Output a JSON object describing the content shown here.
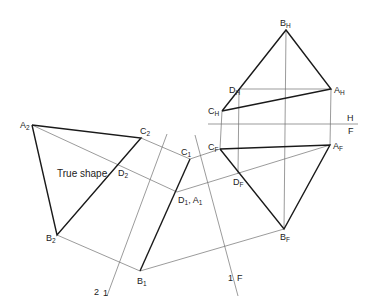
{
  "diagram": {
    "type": "descriptive-geometry-true-shape",
    "annotation": "True shape",
    "reference_lines": {
      "HF": {
        "upper_label": "H",
        "lower_label": "F"
      },
      "F1": {
        "label_left": "1",
        "label_right": "F"
      },
      "12": {
        "label_left": "2",
        "label_right": "1"
      }
    },
    "points": {
      "BH": {
        "base": "B",
        "sub": "H"
      },
      "DH": {
        "base": "D",
        "sub": "H"
      },
      "AH": {
        "base": "A",
        "sub": "H"
      },
      "CH": {
        "base": "C",
        "sub": "H"
      },
      "CF": {
        "base": "C",
        "sub": "F"
      },
      "AF": {
        "base": "A",
        "sub": "F"
      },
      "DF": {
        "base": "D",
        "sub": "F"
      },
      "BF": {
        "base": "B",
        "sub": "F"
      },
      "C1": {
        "base": "C",
        "sub": "1"
      },
      "D1A1": {
        "base": "D",
        "sub": "1",
        "sep": ", ",
        "base2": "A",
        "sub2": "1"
      },
      "B1": {
        "base": "B",
        "sub": "1"
      },
      "A2": {
        "base": "A",
        "sub": "2"
      },
      "C2": {
        "base": "C",
        "sub": "2"
      },
      "D2": {
        "base": "D",
        "sub": "2"
      },
      "B2": {
        "base": "B",
        "sub": "2"
      }
    }
  }
}
